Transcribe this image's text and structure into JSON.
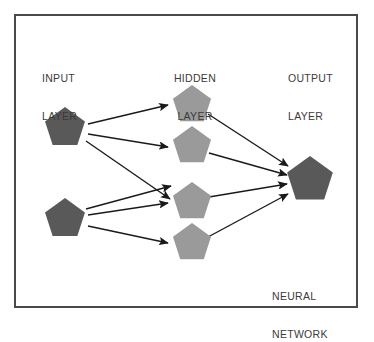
{
  "diagram": {
    "title_line1": "NEURAL",
    "title_line2": "NETWORK",
    "background_color": "#ffffff",
    "border_color": "#4a4a4a",
    "text_color": "#3b3b3b",
    "edge_color": "#1a1a1a",
    "layers": [
      {
        "id": "input",
        "label_line1": "INPUT",
        "label_line2": "LAYER",
        "node_fill": "#595959",
        "node_count": 2,
        "nodes": [
          {
            "name": "input-node-1",
            "cx": 65,
            "cy": 128,
            "r": 21
          },
          {
            "name": "input-node-2",
            "cx": 65,
            "cy": 219,
            "r": 21
          }
        ]
      },
      {
        "id": "hidden",
        "label_line1": "HIDDEN",
        "label_line2": "LAYER",
        "node_fill": "#9a9a9a",
        "node_count": 4,
        "nodes": [
          {
            "name": "hidden-node-1",
            "cx": 192,
            "cy": 105,
            "r": 20
          },
          {
            "name": "hidden-node-2",
            "cx": 192,
            "cy": 146,
            "r": 20
          },
          {
            "name": "hidden-node-3",
            "cx": 192,
            "cy": 202,
            "r": 20
          },
          {
            "name": "hidden-node-4",
            "cx": 192,
            "cy": 243,
            "r": 20
          }
        ]
      },
      {
        "id": "output",
        "label_line1": "OUTPUT",
        "label_line2": "LAYER",
        "node_fill": "#595959",
        "node_count": 1,
        "nodes": [
          {
            "name": "output-node-1",
            "cx": 310,
            "cy": 180,
            "r": 24
          }
        ]
      }
    ],
    "edges": [
      {
        "name": "edge-input1-hidden1",
        "x1": 88,
        "y1": 124,
        "x2": 168,
        "y2": 105
      },
      {
        "name": "edge-input1-hidden2",
        "x1": 88,
        "y1": 134,
        "x2": 168,
        "y2": 147
      },
      {
        "name": "edge-input1-hidden3",
        "x1": 86,
        "y1": 141,
        "x2": 170,
        "y2": 199
      },
      {
        "name": "edge-input2-hidden2",
        "x1": 86,
        "y1": 209,
        "x2": 171,
        "y2": 186
      },
      {
        "name": "edge-input2-hidden3",
        "x1": 88,
        "y1": 215,
        "x2": 168,
        "y2": 203
      },
      {
        "name": "edge-input2-hidden4",
        "x1": 88,
        "y1": 226,
        "x2": 168,
        "y2": 243
      },
      {
        "name": "edge-hidden1-output",
        "x1": 208,
        "y1": 114,
        "x2": 288,
        "y2": 166
      },
      {
        "name": "edge-hidden2-output",
        "x1": 209,
        "y1": 153,
        "x2": 287,
        "y2": 175
      },
      {
        "name": "edge-hidden3-output",
        "x1": 209,
        "y1": 197,
        "x2": 287,
        "y2": 184
      },
      {
        "name": "edge-hidden4-output",
        "x1": 208,
        "y1": 237,
        "x2": 288,
        "y2": 194
      }
    ]
  }
}
